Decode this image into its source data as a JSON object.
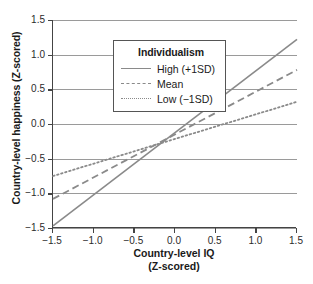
{
  "chart_data": {
    "type": "line",
    "title": "",
    "xlabel": "Country-level IQ",
    "xlabel_line2": "(Z-scored)",
    "ylabel": "Country-level happiness (Z-scored)",
    "xlim": [
      -1.5,
      1.5
    ],
    "ylim": [
      -1.5,
      1.5
    ],
    "xticks": [
      -1.5,
      -1.0,
      -0.5,
      0.0,
      0.5,
      1.0,
      1.5
    ],
    "xticklabels": [
      "−1.5",
      "−1.0",
      "−0.5",
      "0.0",
      "0.5",
      "1.0",
      "1.5"
    ],
    "yticks": [
      -1.5,
      -1.0,
      -0.5,
      0.0,
      0.5,
      1.0,
      1.5
    ],
    "yticklabels": [
      "−1.5",
      "−1.0",
      "−0.5",
      "0.0",
      "0.5",
      "1.0",
      "1.5"
    ],
    "grid": "horizontal",
    "grid_color": "#9a9a9a",
    "line_color": "#8a8a8a",
    "legend_position": "top-left",
    "legend_title": "Individualism",
    "x": [
      -1.5,
      1.5
    ],
    "series": [
      {
        "name": "High (+1SD)",
        "style": "solid",
        "values": [
          -1.47,
          1.22
        ]
      },
      {
        "name": "Mean",
        "style": "dashed",
        "values": [
          -1.08,
          0.78
        ]
      },
      {
        "name": "Low (−1SD)",
        "style": "dotted",
        "values": [
          -0.75,
          0.32
        ]
      }
    ]
  },
  "legend": {
    "title": "Individualism",
    "items": [
      {
        "label": "High (+1SD)"
      },
      {
        "label": "Mean"
      },
      {
        "label": "Low (−1SD)"
      }
    ]
  },
  "axes": {
    "x_title": "Country-level IQ",
    "x_title_line2": "(Z-scored)",
    "y_title": "Country-level happiness (Z-scored)"
  }
}
